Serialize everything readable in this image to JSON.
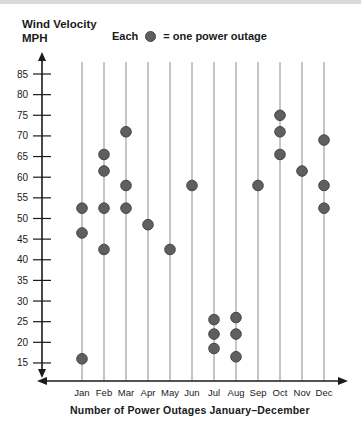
{
  "page": {
    "top_strip_color": "#d9d9d9"
  },
  "header": {
    "title_line1": "Wind Velocity",
    "title_line2": "MPH"
  },
  "legend": {
    "prefix": "Each",
    "dot_icon": "filled-circle",
    "suffix": "= one power outage"
  },
  "caption": "Number of Power Outages January–December",
  "chart_data": {
    "type": "scatter",
    "subtype": "pictograph-dot-plot",
    "ylabel": "Wind Velocity MPH",
    "xlabel": "Number of Power Outages January–December",
    "legend_text": "Each ● = one power outage",
    "categories": [
      "Jan",
      "Feb",
      "Mar",
      "Apr",
      "May",
      "Jun",
      "Jul",
      "Aug",
      "Sep",
      "Oct",
      "Nov",
      "Dec"
    ],
    "values": [
      [
        52.5,
        46.5,
        16
      ],
      [
        65.5,
        61.5,
        52.5,
        42.5
      ],
      [
        71,
        58,
        52.5
      ],
      [
        48.5
      ],
      [
        42.5
      ],
      [
        58
      ],
      [
        25.5,
        22,
        18.5
      ],
      [
        26,
        22,
        16.5
      ],
      [
        58
      ],
      [
        75,
        71,
        65.5
      ],
      [
        61.5
      ],
      [
        69,
        58,
        52.5
      ]
    ],
    "y_ticks": [
      85,
      80,
      75,
      70,
      65,
      60,
      55,
      50,
      45,
      40,
      35,
      30,
      25,
      20,
      15
    ],
    "ylim": [
      13,
      88
    ],
    "grid": "vertical-month-lines",
    "legend_position": "top",
    "marker": "circle",
    "colors": {
      "dot_fill": "#5f5f5f",
      "dot_stroke": "#454545",
      "grid_line": "#8c8c8c",
      "axis": "#1a1a1a",
      "text": "#1a1a1a"
    }
  }
}
